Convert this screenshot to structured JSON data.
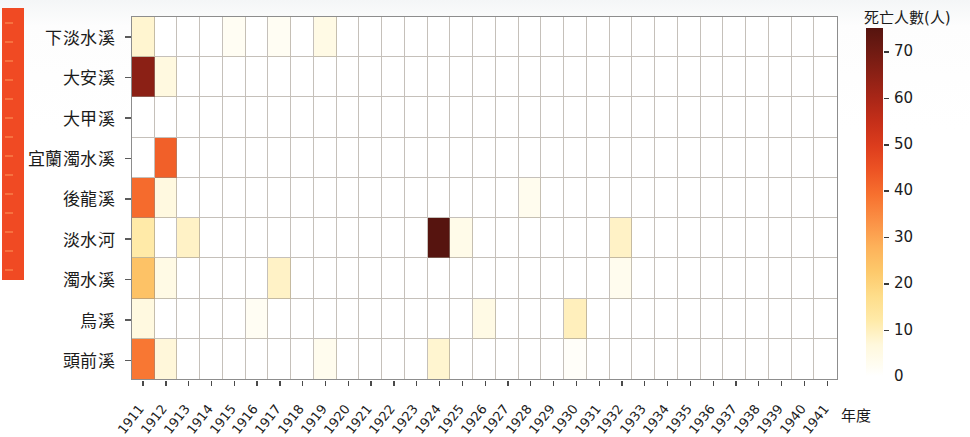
{
  "chart_data": {
    "type": "heatmap",
    "title": "",
    "xlabel": "年度",
    "ylabel": "",
    "colorbar_title": "死亡人數(人)",
    "colorbar_ticks": [
      0,
      10,
      20,
      30,
      40,
      50,
      60,
      70
    ],
    "zlim": [
      0,
      75
    ],
    "colormap": "hot_r / YlOrRd-dark",
    "grid": true,
    "legend_position": "right",
    "x_categories": [
      "1911",
      "1912",
      "1913",
      "1914",
      "1915",
      "1916",
      "1917",
      "1918",
      "1919",
      "1920",
      "1921",
      "1922",
      "1923",
      "1924",
      "1925",
      "1926",
      "1927",
      "1928",
      "1929",
      "1930",
      "1931",
      "1932",
      "1933",
      "1934",
      "1935",
      "1936",
      "1937",
      "1938",
      "1939",
      "1940",
      "1941"
    ],
    "y_categories": [
      "下淡水溪",
      "大安溪",
      "大甲溪",
      "宜蘭濁水溪",
      "後龍溪",
      "淡水河",
      "濁水溪",
      "烏溪",
      "頭前溪"
    ],
    "values": [
      [
        8,
        0,
        0,
        0,
        2,
        0,
        2,
        0,
        5,
        0,
        0,
        0,
        0,
        0,
        0,
        0,
        0,
        0,
        0,
        0,
        0,
        0,
        0,
        0,
        0,
        0,
        0,
        0,
        0,
        0,
        0
      ],
      [
        65,
        6,
        0,
        0,
        0,
        0,
        0,
        0,
        0,
        0,
        0,
        0,
        0,
        0,
        0,
        0,
        0,
        0,
        0,
        0,
        0,
        0,
        0,
        0,
        0,
        0,
        0,
        0,
        0,
        0,
        0
      ],
      [
        0,
        0,
        0,
        0,
        0,
        0,
        0,
        0,
        0,
        0,
        0,
        0,
        0,
        0,
        0,
        0,
        0,
        0,
        0,
        0,
        0,
        0,
        0,
        0,
        0,
        0,
        0,
        0,
        0,
        0,
        0
      ],
      [
        0,
        42,
        0,
        0,
        0,
        0,
        0,
        0,
        0,
        0,
        0,
        0,
        0,
        0,
        0,
        0,
        0,
        0,
        0,
        0,
        0,
        0,
        0,
        0,
        0,
        0,
        0,
        0,
        0,
        0,
        0
      ],
      [
        40,
        6,
        0,
        0,
        0,
        0,
        0,
        0,
        0,
        0,
        0,
        0,
        0,
        0,
        0,
        0,
        0,
        3,
        0,
        0,
        0,
        0,
        0,
        0,
        0,
        0,
        0,
        0,
        0,
        0,
        0
      ],
      [
        12,
        0,
        9,
        0,
        0,
        0,
        0,
        0,
        0,
        0,
        0,
        0,
        0,
        75,
        4,
        0,
        0,
        0,
        0,
        0,
        0,
        9,
        0,
        0,
        0,
        0,
        0,
        0,
        0,
        0,
        0
      ],
      [
        24,
        5,
        0,
        0,
        0,
        0,
        9,
        0,
        0,
        0,
        0,
        0,
        0,
        0,
        0,
        0,
        0,
        0,
        0,
        0,
        0,
        3,
        0,
        0,
        0,
        0,
        0,
        0,
        0,
        0,
        0
      ],
      [
        6,
        0,
        0,
        0,
        0,
        2,
        0,
        0,
        0,
        0,
        0,
        0,
        0,
        0,
        0,
        5,
        0,
        0,
        0,
        10,
        0,
        0,
        0,
        0,
        0,
        0,
        0,
        0,
        0,
        0,
        0
      ],
      [
        38,
        7,
        0,
        0,
        0,
        0,
        0,
        0,
        3,
        0,
        0,
        0,
        0,
        8,
        0,
        0,
        0,
        0,
        0,
        1,
        0,
        0,
        0,
        0,
        0,
        0,
        0,
        0,
        0,
        0,
        0
      ]
    ]
  }
}
